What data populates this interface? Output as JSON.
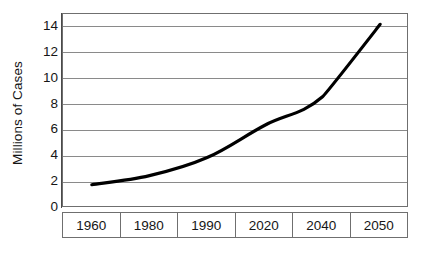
{
  "chart_data": {
    "type": "line",
    "title": "",
    "xlabel": "",
    "ylabel": "Millions of Cases",
    "categories": [
      "1960",
      "1980",
      "1990",
      "2020",
      "2040",
      "2050"
    ],
    "values": [
      1.8,
      2.5,
      3.9,
      6.4,
      8.6,
      14.2
    ],
    "series": [
      {
        "name": "Cases",
        "values": [
          1.8,
          2.5,
          3.9,
          6.4,
          8.6,
          14.2
        ]
      }
    ],
    "ylim": [
      0,
      15
    ],
    "xlim": [
      0,
      6
    ],
    "y_ticks": [
      0,
      2,
      4,
      6,
      8,
      10,
      12,
      14
    ],
    "y_tick_labels": [
      "0",
      "2",
      "4",
      "6",
      "8",
      "10",
      "12",
      "14"
    ],
    "grid": true,
    "grid_axis": "y",
    "legend": false,
    "legend_position": "none",
    "line_color": "#000000",
    "grid_color": "#8a8a8a",
    "frame_color": "#6f6f6f",
    "background_color": "#ffffff",
    "marker": "none",
    "annotations": []
  }
}
